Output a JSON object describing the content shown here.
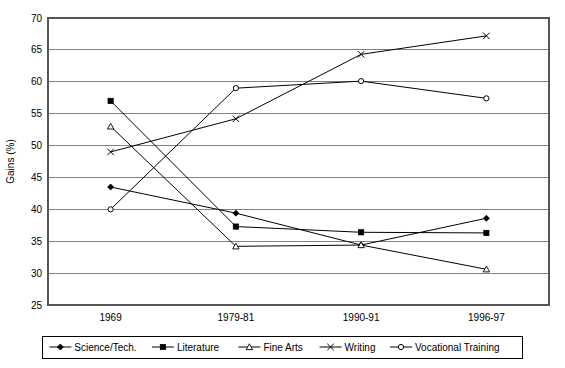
{
  "chart_data": {
    "type": "line",
    "title": "",
    "xlabel": "",
    "ylabel": "Gains (%)",
    "categories": [
      "1969",
      "1979-81",
      "1990-91",
      "1996-97"
    ],
    "ylim": [
      25,
      70
    ],
    "yticks": [
      25,
      30,
      35,
      40,
      45,
      50,
      55,
      60,
      65,
      70
    ],
    "ytick_labels": [
      "25",
      "30",
      "35",
      "40",
      "45",
      "50",
      "55",
      "60",
      "65",
      "70"
    ],
    "grid": true,
    "legend_position": "bottom",
    "series": [
      {
        "name": "Science/Tech.",
        "marker": "filled-diamond",
        "color": "#000000",
        "values": [
          43.5,
          39.4,
          34.4,
          38.6
        ]
      },
      {
        "name": "Literature",
        "marker": "filled-square",
        "color": "#000000",
        "values": [
          57.0,
          37.3,
          36.4,
          36.3
        ]
      },
      {
        "name": "Fine Arts",
        "marker": "open-triangle",
        "color": "#000000",
        "values": [
          53.0,
          34.2,
          34.4,
          30.6
        ]
      },
      {
        "name": "Writing",
        "marker": "cross-x",
        "color": "#000000",
        "values": [
          49.0,
          54.2,
          64.3,
          67.2
        ]
      },
      {
        "name": "Vocational Training",
        "marker": "open-circle",
        "color": "#000000",
        "values": [
          40.0,
          59.0,
          60.1,
          57.4
        ]
      }
    ]
  }
}
